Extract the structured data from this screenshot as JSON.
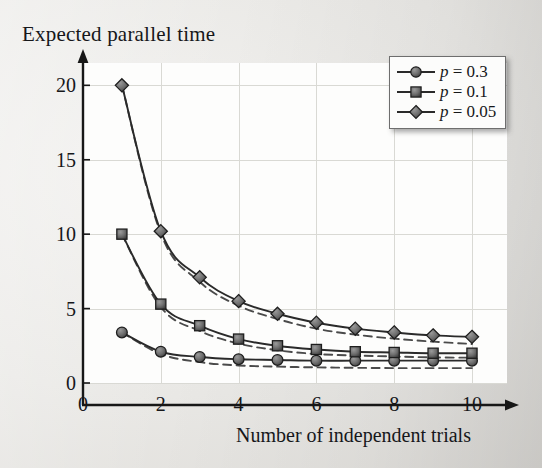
{
  "chart_data": {
    "type": "line",
    "title": "Expected parallel time",
    "xlabel": "Number of independent trials",
    "ylabel": "Expected parallel time",
    "xlim": [
      0,
      10.9
    ],
    "ylim": [
      0,
      21.5
    ],
    "x_ticks": [
      "0",
      "2",
      "4",
      "6",
      "8",
      "10"
    ],
    "x_tick_values": [
      0,
      2,
      4,
      6,
      8,
      10
    ],
    "y_ticks": [
      "0",
      "5",
      "10",
      "15",
      "20"
    ],
    "y_tick_values": [
      0,
      5,
      10,
      15,
      20
    ],
    "grid": true,
    "legend_position": "top-right",
    "x": [
      1,
      2,
      3,
      4,
      5,
      6,
      7,
      8,
      9,
      10
    ],
    "series": [
      {
        "name": "p = 0.3",
        "marker": "circle",
        "style": "solid",
        "values": [
          3.4,
          2.1,
          1.75,
          1.6,
          1.55,
          1.5,
          1.5,
          1.5,
          1.5,
          1.5
        ]
      },
      {
        "name": "p = 0.1",
        "marker": "square",
        "style": "solid",
        "values": [
          10.0,
          5.3,
          3.85,
          2.95,
          2.5,
          2.25,
          2.1,
          2.05,
          2.0,
          2.0
        ]
      },
      {
        "name": "p = 0.05",
        "marker": "diamond",
        "style": "solid",
        "values": [
          20.0,
          10.2,
          7.1,
          5.5,
          4.65,
          4.05,
          3.65,
          3.4,
          3.2,
          3.1
        ]
      },
      {
        "name": "p = 0.3 reference",
        "marker": "none",
        "style": "dashed",
        "values": [
          3.4,
          1.95,
          1.4,
          1.18,
          1.1,
          1.05,
          1.02,
          1.0,
          1.0,
          1.0
        ]
      },
      {
        "name": "p = 0.1 reference",
        "marker": "none",
        "style": "dashed",
        "values": [
          10.0,
          5.1,
          3.5,
          2.65,
          2.2,
          1.95,
          1.85,
          1.78,
          1.72,
          1.7
        ]
      },
      {
        "name": "p = 0.05 reference",
        "marker": "none",
        "style": "dashed",
        "values": [
          20.0,
          10.05,
          6.8,
          5.2,
          4.3,
          3.65,
          3.25,
          2.98,
          2.78,
          2.62
        ]
      }
    ],
    "legend": [
      {
        "label": "p = 0.3",
        "p_symbol": "p",
        "equals_value": "= 0.3",
        "marker": "circle"
      },
      {
        "label": "p = 0.1",
        "p_symbol": "p",
        "equals_value": "= 0.1",
        "marker": "square"
      },
      {
        "label": "p = 0.05",
        "p_symbol": "p",
        "equals_value": "= 0.05",
        "marker": "diamond"
      }
    ],
    "colors": {
      "marker_fill": "#6b6b6b",
      "marker_edge": "#1d1d1d",
      "line": "#2a2a2a",
      "dashed_line": "#4a4a4a",
      "grid": "#d9d9d4",
      "axis": "#171717",
      "plot_background": "#fdfdfc",
      "page_background": "#e9e8e5"
    }
  }
}
